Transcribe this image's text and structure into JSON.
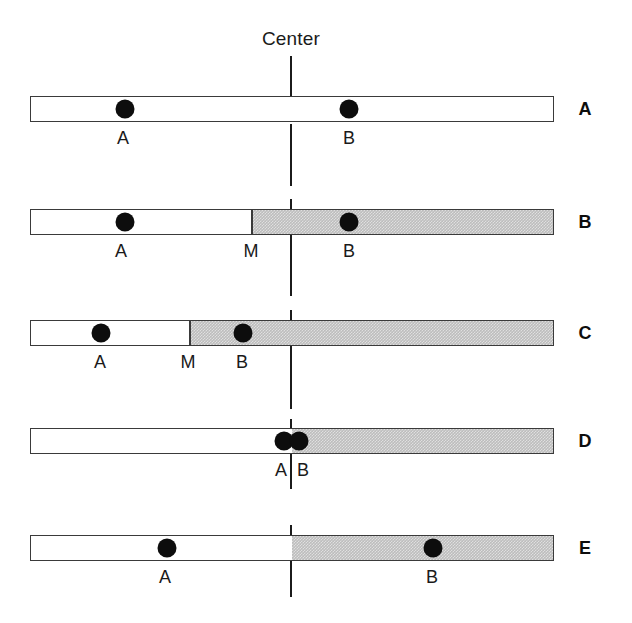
{
  "figure": {
    "center_axis": {
      "label": "Center",
      "label_x": 291,
      "label_y": 28,
      "x": 291,
      "segments": [
        {
          "y": 56,
          "height": 46
        },
        {
          "y": 124,
          "height": 62
        },
        {
          "y": 199,
          "height": 16
        },
        {
          "y": 232,
          "height": 64
        },
        {
          "y": 310,
          "height": 14
        },
        {
          "y": 341,
          "height": 68
        },
        {
          "y": 419,
          "height": 16
        },
        {
          "y": 451,
          "height": 38
        },
        {
          "y": 525,
          "height": 16
        },
        {
          "y": 557,
          "height": 40
        }
      ]
    },
    "geometry": {
      "bar_left": 30,
      "bar_right": 554,
      "bar_height": 26,
      "dot_diameter": 19,
      "label_letter_x": 585
    },
    "rows": [
      {
        "letter": "A",
        "bar_y": 96,
        "bar_left": 30,
        "bar_right": 554,
        "shade_start": null,
        "divider_x": null,
        "dots": [
          {
            "name": "A",
            "x": 125
          },
          {
            "name": "B",
            "x": 349
          }
        ],
        "tick_labels": [
          {
            "text": "A",
            "x": 123,
            "y": 128
          },
          {
            "text": "B",
            "x": 349,
            "y": 128
          }
        ]
      },
      {
        "letter": "B",
        "bar_y": 209,
        "bar_left": 30,
        "bar_right": 554,
        "shade_start": 250,
        "divider_x": 250,
        "dots": [
          {
            "name": "A",
            "x": 125
          },
          {
            "name": "B",
            "x": 349
          }
        ],
        "tick_labels": [
          {
            "text": "A",
            "x": 121,
            "y": 241
          },
          {
            "text": "M",
            "x": 251,
            "y": 241
          },
          {
            "text": "B",
            "x": 349,
            "y": 241
          }
        ]
      },
      {
        "letter": "C",
        "bar_y": 320,
        "bar_left": 30,
        "bar_right": 554,
        "shade_start": 188,
        "divider_x": 188,
        "dots": [
          {
            "name": "A",
            "x": 101
          },
          {
            "name": "B",
            "x": 243
          }
        ],
        "tick_labels": [
          {
            "text": "A",
            "x": 100,
            "y": 352
          },
          {
            "text": "M",
            "x": 188,
            "y": 352
          },
          {
            "text": "B",
            "x": 242,
            "y": 352
          }
        ]
      },
      {
        "letter": "D",
        "bar_y": 428,
        "bar_left": 30,
        "bar_right": 554,
        "shade_start": 291,
        "divider_x": null,
        "dots": [
          {
            "name": "A",
            "x": 284
          },
          {
            "name": "B",
            "x": 299
          }
        ],
        "tick_labels": [
          {
            "text": "A",
            "x": 281,
            "y": 460
          },
          {
            "text": "B",
            "x": 303,
            "y": 460
          }
        ]
      },
      {
        "letter": "E",
        "bar_y": 535,
        "bar_left": 30,
        "bar_right": 554,
        "shade_start": 291,
        "divider_x": null,
        "dots": [
          {
            "name": "A",
            "x": 167
          },
          {
            "name": "B",
            "x": 433
          }
        ],
        "tick_labels": [
          {
            "text": "A",
            "x": 165,
            "y": 567
          },
          {
            "text": "B",
            "x": 432,
            "y": 567
          }
        ]
      }
    ]
  },
  "colors": {
    "shade": "#bdbdbd",
    "outline": "#3a3a3a",
    "dot": "#0d0d0d",
    "line": "#1b1b1b",
    "text": "#1a1a1a"
  }
}
